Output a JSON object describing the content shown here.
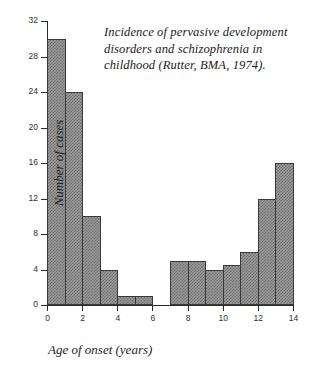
{
  "chart_data": {
    "type": "bar",
    "title": "Incidence of pervasive development disorders and schizophrenia in childhood (Rutter, BMA, 1974).",
    "title_lines": [
      "Incidence of pervasive development",
      "disorders and schizophrenia in",
      "childhood (Rutter, BMA, 1974)."
    ],
    "xlabel": "Age of onset (years)",
    "ylabel": "Number of cases",
    "xlim": [
      0,
      14
    ],
    "ylim": [
      0,
      32
    ],
    "grid": false,
    "legend": null,
    "xticks": [
      0,
      2,
      4,
      6,
      8,
      10,
      12,
      14
    ],
    "xtick_labels": [
      "0",
      "2",
      "4",
      "6",
      "8",
      "10",
      "12",
      "14"
    ],
    "yticks": [
      0,
      4,
      8,
      12,
      16,
      20,
      24,
      28,
      32
    ],
    "ytick_labels": [
      "0",
      "4",
      "8",
      "12",
      "16",
      "20",
      "24",
      "28",
      "32"
    ],
    "bin_width": 1,
    "bins": [
      {
        "x0": 0,
        "x1": 1,
        "value": 30
      },
      {
        "x0": 1,
        "x1": 2,
        "value": 24
      },
      {
        "x0": 2,
        "x1": 3,
        "value": 10
      },
      {
        "x0": 3,
        "x1": 4,
        "value": 4
      },
      {
        "x0": 4,
        "x1": 5,
        "value": 1
      },
      {
        "x0": 5,
        "x1": 6,
        "value": 1
      },
      {
        "x0": 6,
        "x1": 7,
        "value": 0
      },
      {
        "x0": 7,
        "x1": 8,
        "value": 5
      },
      {
        "x0": 8,
        "x1": 9,
        "value": 5
      },
      {
        "x0": 9,
        "x1": 10,
        "value": 4
      },
      {
        "x0": 10,
        "x1": 11,
        "value": 4.5
      },
      {
        "x0": 11,
        "x1": 12,
        "value": 6
      },
      {
        "x0": 12,
        "x1": 13,
        "value": 12
      },
      {
        "x0": 13,
        "x1": 14,
        "value": 16
      }
    ],
    "categories": [
      "0-1",
      "1-2",
      "2-3",
      "3-4",
      "4-5",
      "5-6",
      "6-7",
      "7-8",
      "8-9",
      "9-10",
      "10-11",
      "11-12",
      "12-13",
      "13-14"
    ],
    "values": [
      30,
      24,
      10,
      4,
      1,
      1,
      0,
      5,
      5,
      4,
      4.5,
      6,
      12,
      16
    ],
    "colors": {
      "bar_fill": "#9a9a9a",
      "bar_hatch": "#6f6f6f",
      "bar_edge": "#3a3a3a",
      "axis": "#2a2a2a",
      "text": "#1b1b1b",
      "background": "#ffffff"
    }
  }
}
